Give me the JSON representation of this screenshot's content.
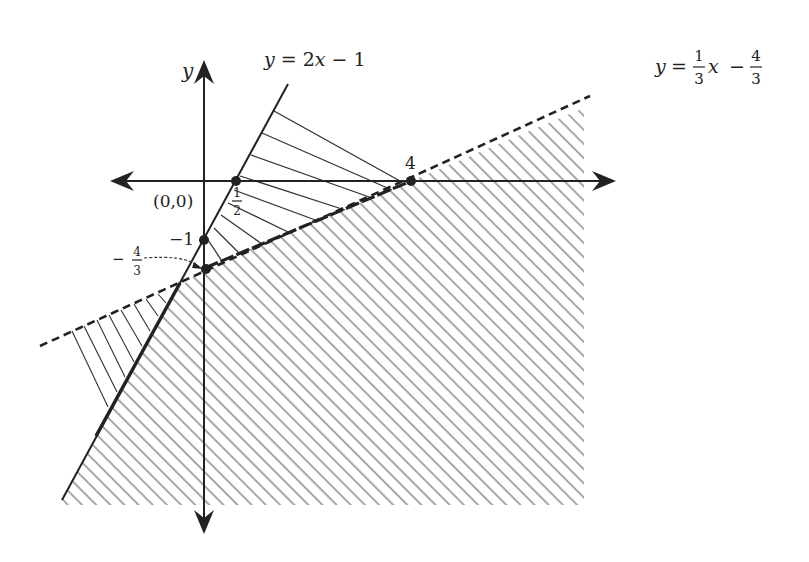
{
  "diagram": {
    "type": "linear-inequality-region-graph",
    "axes": {
      "x_axis": {
        "label": "",
        "arrows": "both"
      },
      "y_axis": {
        "label": "y",
        "arrows": "both"
      }
    },
    "lines": [
      {
        "id": "line1",
        "equation": "y = 2x − 1",
        "style": "solid",
        "label_parts": {
          "lhs": "y",
          "eq": " = 2",
          "var": "x",
          "rest": " − 1"
        }
      },
      {
        "id": "line2",
        "equation": "y = (1/3)x − 4/3",
        "style": "dashed",
        "label_parts": {
          "lhs": "y",
          "eq": "=",
          "frac1_num": "1",
          "frac1_den": "3",
          "var": "x",
          "minus": "−",
          "frac2_num": "4",
          "frac2_den": "3"
        }
      }
    ],
    "points": [
      {
        "label": "(0,0)",
        "meaning": "origin"
      },
      {
        "label_num": "1",
        "label_den": "2",
        "meaning": "x-intercept of y=2x-1"
      },
      {
        "label": "−1",
        "meaning": "y-intercept of y=2x-1"
      },
      {
        "label_sign": "−",
        "label_num": "4",
        "label_den": "3",
        "meaning": "y-intercept of y=(1/3)x-4/3"
      },
      {
        "label": "4",
        "meaning": "x-intercept of y=(1/3)x-4/3"
      }
    ],
    "regions": [
      {
        "id": "upper-black-hatch",
        "description": "region between lines above x-axis, thin black hatching"
      },
      {
        "id": "lower-left-black-hatch",
        "description": "region left of intersection between lines, thin black hatching"
      },
      {
        "id": "gray-hatch",
        "description": "region below dashed line and right of solid line, gray diagonal hatching"
      }
    ],
    "colors": {
      "line": "#222222",
      "gray_hatch": "#a8a8a8",
      "background": "#ffffff"
    }
  }
}
